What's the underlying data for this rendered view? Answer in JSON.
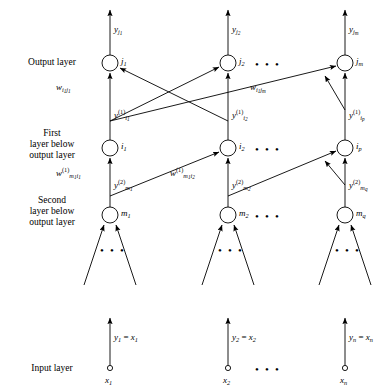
{
  "figure": {
    "type": "neural-network-architecture-diagram"
  },
  "layer_names": {
    "output": "Output layer",
    "first_below": [
      "First",
      "layer below",
      "output layer"
    ],
    "second_below": [
      "Second",
      "layer below",
      "output layer"
    ],
    "input": "Input layer"
  },
  "columns": {
    "x": [
      110,
      228,
      345
    ],
    "ellipsis_x": 268
  },
  "output_layer": {
    "y": 63,
    "nodes": [
      {
        "id": "j1",
        "label_html": "j<sub>1</sub>",
        "x": 110
      },
      {
        "id": "j2",
        "label_html": "j<sub>2</sub>",
        "x": 228
      },
      {
        "id": "jm",
        "label_html": "j<sub>m</sub>",
        "x": 345
      }
    ],
    "outputs": [
      {
        "id": "y_j1",
        "label_html": "y<sub>j<sub>1</sub></sub>",
        "x": 110
      },
      {
        "id": "y_j2",
        "label_html": "y<sub>j<sub>2</sub></sub>",
        "x": 228
      },
      {
        "id": "y_jm",
        "label_html": "y<sub>j<sub>m</sub></sub>",
        "x": 345
      }
    ]
  },
  "first_hidden_layer": {
    "y": 148,
    "nodes": [
      {
        "id": "i1",
        "label_html": "i<sub>1</sub>",
        "x": 110
      },
      {
        "id": "i2",
        "label_html": "i<sub>2</sub>",
        "x": 228
      },
      {
        "id": "ip",
        "label_html": "i<sub>p</sub>",
        "x": 345
      }
    ],
    "signals": [
      {
        "id": "y1_i1",
        "label_html": "y<sup>(1)</sup><sub>i<sub>1</sub></sub>",
        "x": 110
      },
      {
        "id": "y1_i2",
        "label_html": "y<sup>(1)</sup><sub>i<sub>2</sub></sub>",
        "x": 228
      },
      {
        "id": "y1_ip",
        "label_html": "y<sup>(1)</sup><sub>i<sub>p</sub></sub>",
        "x": 345
      }
    ]
  },
  "second_hidden_layer": {
    "y": 215,
    "nodes": [
      {
        "id": "m1",
        "label_html": "m<sub>1</sub>",
        "x": 110
      },
      {
        "id": "m2",
        "label_html": "m<sub>2</sub>",
        "x": 228
      },
      {
        "id": "mq",
        "label_html": "m<sub>q</sub>",
        "x": 345
      }
    ],
    "signals": [
      {
        "id": "y2_m1",
        "label_html": "y<sup>(2)</sup><sub>m<sub>1</sub></sub>",
        "x": 110
      },
      {
        "id": "y2_m2",
        "label_html": "y<sup>(2)</sup><sub>m<sub>2</sub></sub>",
        "x": 228
      },
      {
        "id": "y2_mq",
        "label_html": "y<sup>(2)</sup><sub>m<sub>q</sub></sub>",
        "x": 345
      }
    ]
  },
  "input_layer": {
    "y": 368,
    "nodes": [
      {
        "id": "x1",
        "label_html": "x<sub>1</sub>",
        "x": 110
      },
      {
        "id": "x2",
        "label_html": "x<sub>2</sub>",
        "x": 228
      },
      {
        "id": "xn",
        "label_html": "x<sub>n</sub>",
        "x": 345
      }
    ],
    "signals": [
      {
        "id": "y1_eq_x1",
        "label_html": "y<sub>1</sub> <span class=\"op\">=</span> x<sub>1</sub>",
        "x": 110
      },
      {
        "id": "y2_eq_x2",
        "label_html": "y<sub>2</sub> <span class=\"op\">=</span> x<sub>2</sub>",
        "x": 228
      },
      {
        "id": "yn_eq_xn",
        "label_html": "y<sub>n</sub> <span class=\"op\">=</span> x<sub>n</sub>",
        "x": 345
      }
    ]
  },
  "weights": [
    {
      "id": "w_i1j1",
      "label_html": "w<sub>i<sub>1</sub>j<sub>1</sub></sub>",
      "x": 78,
      "y": 88
    },
    {
      "id": "w_i1jm",
      "label_html": "w<sub>i<sub>1</sub>j<sub>m</sub></sub>",
      "x": 268,
      "y": 88
    },
    {
      "id": "w1_m1i1",
      "label_html": "w<sup>(1)</sup><sub>m<sub>1</sub>i<sub>1</sub></sub>",
      "x": 78,
      "y": 173
    },
    {
      "id": "w1_m1i2",
      "label_html": "w<sup>(1)</sup><sub>m<sub>1</sub>i<sub>2</sub></sub>",
      "x": 192,
      "y": 173
    }
  ],
  "ellipses": {
    "glyph": "•",
    "count": 3,
    "rows": [
      {
        "id": "ellipsis-output-layer",
        "y": 63
      },
      {
        "id": "ellipsis-first-hidden-layer",
        "y": 148
      },
      {
        "id": "ellipsis-second-hidden-layer",
        "y": 215
      },
      {
        "id": "ellipsis-input-layer",
        "y": 368
      }
    ],
    "fanin": [
      {
        "id": "ellipsis-fanin-m1",
        "x": 110,
        "y": 248
      },
      {
        "id": "ellipsis-fanin-m2",
        "x": 228,
        "y": 248
      },
      {
        "id": "ellipsis-fanin-mq",
        "x": 345,
        "y": 248
      }
    ]
  },
  "style": {
    "stroke": "#000000",
    "node_fill": "#ffffff",
    "node_radius": 8,
    "input_node_radius": 2.6,
    "stroke_width": 0.9
  }
}
